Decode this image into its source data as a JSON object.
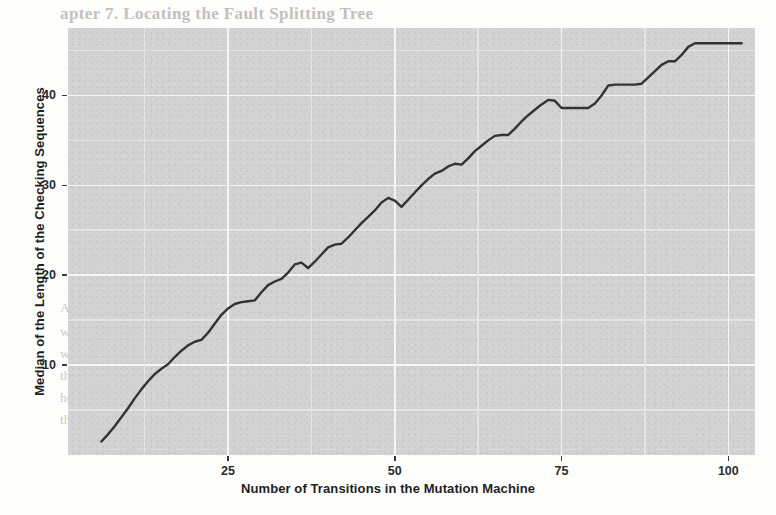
{
  "page": {
    "background_color": "#fdfdfc",
    "panel_color": "#d2d2d2",
    "line_color": "#333333",
    "gridline_major_color": "#f6f6f6",
    "gridline_minor_color": "#e4e4e4",
    "bleed_text_color": "#c9c7c3"
  },
  "scan_bleed": {
    "note": "Faint show-through text from the reverse side of the scanned page",
    "lines": [
      {
        "text": "apter 7.  Locating the Fault Splitting Tree",
        "x": 60,
        "y": 4,
        "cls": "bleed-head"
      },
      {
        "text": "Student ID   Name    Lab Section    Final Grade",
        "x": 96,
        "y": 116,
        "cls": "bleed-body"
      },
      {
        "text": "First transition  was Added to the Checking Sequence",
        "x": 86,
        "y": 158,
        "cls": "bleed-body"
      },
      {
        "text": "the number of transitions in the machine",
        "x": 118,
        "y": 184,
        "cls": "bleed-body"
      },
      {
        "text": "the resulting checking sequence, where",
        "x": 112,
        "y": 214,
        "cls": "bleed-body"
      },
      {
        "text": "Abstract.  Mutation testing is a fault-based technique that determines",
        "x": 60,
        "y": 300,
        "cls": "bleed-body-strong"
      },
      {
        "text": "whether a test suite adequately detects the seeded faults. In this paper",
        "x": 60,
        "y": 324,
        "cls": "bleed-body-strong"
      },
      {
        "text": "we propose a set of mutation operators that can be used to generate",
        "x": 60,
        "y": 346,
        "cls": "bleed-body-strong"
      },
      {
        "text": "the Checking Sequences of Finite State Machines. We also present",
        "x": 60,
        "y": 368,
        "cls": "bleed-body-strong"
      },
      {
        "text": "how the resulting checking sequences are generated",
        "x": 60,
        "y": 390,
        "cls": "bleed-body-strong"
      },
      {
        "text": "the splitting tree; the generation procedure is based on",
        "x": 60,
        "y": 412,
        "cls": "bleed-body-strong"
      }
    ]
  },
  "chart_data": {
    "type": "line",
    "title": "",
    "xlabel": "Number of Transitions in the Mutation Machine",
    "ylabel": "Median of the Length of the Checking Sequences",
    "xlim": [
      1,
      104
    ],
    "ylim": [
      0,
      47.5
    ],
    "xticks": [
      25,
      50,
      75,
      100
    ],
    "yticks": [
      10,
      20,
      30,
      40
    ],
    "xtick_labels": [
      "25",
      "50",
      "75",
      "100"
    ],
    "ytick_labels": [
      "10",
      "20",
      "30",
      "40"
    ],
    "grid": true,
    "grid_major_at_ticks": true,
    "grid_minor_midpoints": true,
    "legend": null,
    "series": [
      {
        "name": "Median length of checking sequences",
        "color": "#333333",
        "line_width": 2.4,
        "x": [
          6,
          7,
          8,
          9,
          10,
          11,
          12,
          13,
          14,
          15,
          16,
          17,
          18,
          19,
          20,
          21,
          22,
          23,
          24,
          25,
          26,
          27,
          28,
          29,
          30,
          31,
          32,
          33,
          34,
          35,
          36,
          37,
          38,
          39,
          40,
          41,
          42,
          43,
          44,
          45,
          46,
          47,
          48,
          49,
          50,
          51,
          52,
          53,
          54,
          55,
          56,
          57,
          58,
          59,
          60,
          61,
          62,
          63,
          64,
          65,
          66,
          67,
          68,
          69,
          70,
          71,
          72,
          73,
          74,
          75,
          76,
          77,
          78,
          79,
          80,
          81,
          82,
          83,
          84,
          85,
          86,
          87,
          88,
          89,
          90,
          91,
          92,
          93,
          94,
          95,
          96,
          97,
          98,
          99,
          100,
          101,
          102
        ],
        "y": [
          1.5,
          2.3,
          3.2,
          4.2,
          5.2,
          6.3,
          7.3,
          8.2,
          9.0,
          9.6,
          10.1,
          10.9,
          11.6,
          12.2,
          12.6,
          12.8,
          13.6,
          14.6,
          15.6,
          16.3,
          16.8,
          17.0,
          17.1,
          17.2,
          18.1,
          18.9,
          19.3,
          19.6,
          20.3,
          21.2,
          21.4,
          20.8,
          21.5,
          22.3,
          23.1,
          23.4,
          23.5,
          24.2,
          25.0,
          25.8,
          26.5,
          27.2,
          28.1,
          28.6,
          28.3,
          27.6,
          28.4,
          29.2,
          30.0,
          30.7,
          31.3,
          31.6,
          32.1,
          32.4,
          32.3,
          33.0,
          33.8,
          34.4,
          35.0,
          35.5,
          35.6,
          35.6,
          36.3,
          37.1,
          37.8,
          38.4,
          39.0,
          39.5,
          39.4,
          38.6,
          38.6,
          38.6,
          38.6,
          38.6,
          39.1,
          40.0,
          41.1,
          41.2,
          41.2,
          41.2,
          41.2,
          41.3,
          42.0,
          42.7,
          43.4,
          43.8,
          43.8,
          44.5,
          45.4,
          45.8,
          45.8,
          45.8,
          45.8,
          45.8,
          45.8,
          45.8,
          45.8
        ]
      }
    ]
  }
}
